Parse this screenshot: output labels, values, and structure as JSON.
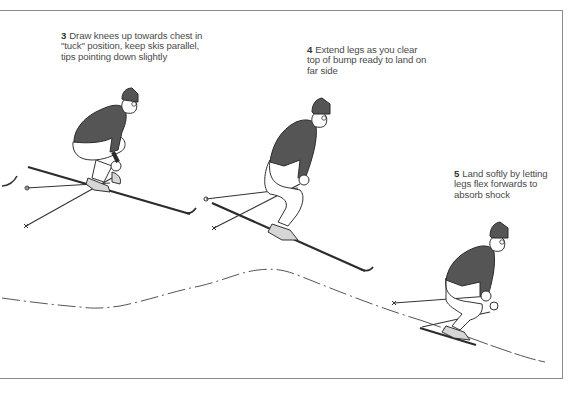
{
  "illustration": {
    "subject": "ski jump over a bump",
    "colors": {
      "jacket": "#555555",
      "outline": "#2b2b2b",
      "boot": "#d6d6d6",
      "border": "#8a8a8a",
      "text": "#4a4a4a"
    }
  },
  "steps": [
    {
      "number": "3",
      "text": "Draw knees up towards chest in \"tuck\" position, keep skis parallel, tips pointing down slightly"
    },
    {
      "number": "4",
      "text": "Extend legs as you clear top of bump ready to land on far side"
    },
    {
      "number": "5",
      "text": "Land softly by letting legs flex forwards to absorb shock"
    }
  ]
}
